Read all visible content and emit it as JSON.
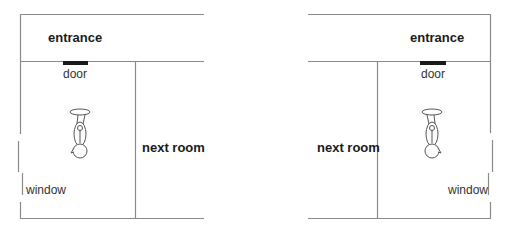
{
  "colors": {
    "wall": "#8a8a8a",
    "door": "#1a1a1a",
    "text": "#1a1a1a",
    "figure": "#555555"
  },
  "left_plan": {
    "entrance_label": "entrance",
    "door_label": "door",
    "next_room_label": "next room",
    "window_label": "window",
    "person_icon": "person-topdown-icon"
  },
  "right_plan": {
    "entrance_label": "entrance",
    "door_label": "door",
    "next_room_label": "next room",
    "window_label": "window",
    "person_icon": "person-topdown-icon"
  }
}
